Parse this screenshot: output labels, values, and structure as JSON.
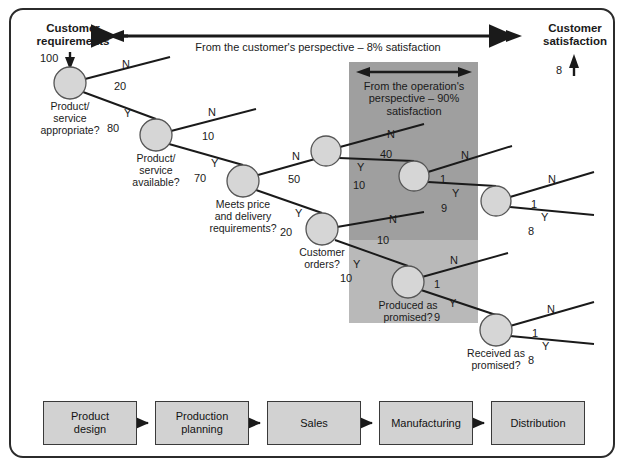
{
  "figure": {
    "title_left": "Customer\nrequirements",
    "title_right": "Customer\nsatisfaction",
    "customer_perspective_note": "From the customer's perspective – 8% satisfaction",
    "operation_perspective_note": "From the operation's\nperspective – 90%\nsatisfaction",
    "input_value": "100",
    "output_value": "8"
  },
  "colors": {
    "node_fill": "#d6d6d6",
    "node_stroke": "#555555",
    "band_dark": "#9f9f9f",
    "band_light": "#b9b9b9",
    "box_fill": "#d2d2d2",
    "box_stroke": "#3a3a3a",
    "line": "#1a1a1a",
    "frame": "#2b2b2b"
  },
  "nodes": [
    {
      "id": "n1",
      "label": "Product/\nservice\nappropriate?",
      "x": 70,
      "y": 83,
      "r": 16
    },
    {
      "id": "n2",
      "label": "Product/\nservice\navailable?",
      "x": 156,
      "y": 135,
      "r": 16
    },
    {
      "id": "n3",
      "label": "Meets price\nand delivery\nrequirements?",
      "x": 243,
      "y": 181,
      "r": 16
    },
    {
      "id": "n4",
      "label": "",
      "x": 326,
      "y": 151,
      "r": 15
    },
    {
      "id": "n5",
      "label": "",
      "x": 414,
      "y": 176,
      "r": 15
    },
    {
      "id": "n6",
      "label": "",
      "x": 496,
      "y": 201,
      "r": 15
    },
    {
      "id": "n7",
      "label": "Customer\norders?",
      "x": 322,
      "y": 229,
      "r": 16
    },
    {
      "id": "n8",
      "label": "Produced as\npromised?",
      "x": 408,
      "y": 282,
      "r": 16
    },
    {
      "id": "n9",
      "label": "Received as\npromised?",
      "x": 496,
      "y": 330,
      "r": 16
    }
  ],
  "branches": [
    {
      "from": "n1",
      "answer": "N",
      "value": "20",
      "ans_x": 122,
      "ans_y": 58,
      "val_x": 114,
      "val_y": 80
    },
    {
      "from": "n1",
      "answer": "Y",
      "value": "80",
      "ans_x": 124,
      "ans_y": 107,
      "val_x": 107,
      "val_y": 122
    },
    {
      "from": "n2",
      "answer": "N",
      "value": "10",
      "ans_x": 208,
      "ans_y": 106,
      "val_x": 202,
      "val_y": 130
    },
    {
      "from": "n2",
      "answer": "Y",
      "value": "70",
      "ans_x": 211,
      "ans_y": 157,
      "val_x": 194,
      "val_y": 172
    },
    {
      "from": "n3",
      "answer": "N",
      "value": "50",
      "ans_x": 292,
      "ans_y": 150,
      "val_x": 288,
      "val_y": 173
    },
    {
      "from": "n3",
      "answer": "Y",
      "value": "20",
      "ans_x": 295,
      "ans_y": 207,
      "val_x": 280,
      "val_y": 226
    },
    {
      "from": "n4",
      "answer": "N",
      "value": "40",
      "ans_x": 387,
      "ans_y": 128,
      "val_x": 380,
      "val_y": 148
    },
    {
      "from": "n4",
      "answer": "Y",
      "value": "10",
      "ans_x": 357,
      "ans_y": 161,
      "val_x": 353,
      "val_y": 179
    },
    {
      "from": "n5",
      "answer": "N",
      "value": "1",
      "ans_x": 461,
      "ans_y": 149,
      "val_x": 440,
      "val_y": 173
    },
    {
      "from": "n5",
      "answer": "Y",
      "value": "9",
      "ans_x": 452,
      "ans_y": 187,
      "val_x": 441,
      "val_y": 202
    },
    {
      "from": "n6",
      "answer": "N",
      "value": "1",
      "ans_x": 548,
      "ans_y": 173,
      "val_x": 531,
      "val_y": 198
    },
    {
      "from": "n6",
      "answer": "Y",
      "value": "8",
      "ans_x": 541,
      "ans_y": 211,
      "val_x": 528,
      "val_y": 225
    },
    {
      "from": "n7",
      "answer": "N",
      "value": "10",
      "ans_x": 389,
      "ans_y": 213,
      "val_x": 377,
      "val_y": 234
    },
    {
      "from": "n7",
      "answer": "Y",
      "value": "10",
      "ans_x": 353,
      "ans_y": 258,
      "val_x": 340,
      "val_y": 272
    },
    {
      "from": "n8",
      "answer": "N",
      "value": "1",
      "ans_x": 450,
      "ans_y": 254,
      "val_x": 434,
      "val_y": 278
    },
    {
      "from": "n8",
      "answer": "Y",
      "value": "9",
      "ans_x": 449,
      "ans_y": 297,
      "val_x": 434,
      "val_y": 311
    },
    {
      "from": "n9",
      "answer": "N",
      "value": "1",
      "ans_x": 547,
      "ans_y": 303,
      "val_x": 532,
      "val_y": 327
    },
    {
      "from": "n9",
      "answer": "Y",
      "value": "8",
      "ans_x": 542,
      "ans_y": 340,
      "val_x": 528,
      "val_y": 354
    }
  ],
  "process_chain": {
    "boxes": [
      {
        "label": "Product\ndesign",
        "x": 43,
        "y": 401,
        "w": 94,
        "h": 44
      },
      {
        "label": "Production\nplanning",
        "x": 155,
        "y": 401,
        "w": 94,
        "h": 44
      },
      {
        "label": "Sales",
        "x": 267,
        "y": 401,
        "w": 94,
        "h": 44
      },
      {
        "label": "Manufacturing",
        "x": 379,
        "y": 401,
        "w": 94,
        "h": 44
      },
      {
        "label": "Distribution",
        "x": 491,
        "y": 401,
        "w": 94,
        "h": 44
      }
    ]
  }
}
